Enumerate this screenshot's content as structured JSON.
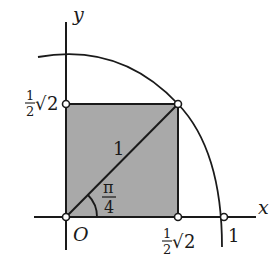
{
  "diagram": {
    "axes": {
      "x_label": "x",
      "y_label": "y",
      "origin_label": "O"
    },
    "labels": {
      "hypotenuse": "1",
      "x_intercept": "1",
      "angle_num": "π",
      "angle_den": "4",
      "half_num": "1",
      "half_den": "2",
      "sqrt_symbol": "√",
      "sqrt_arg": "2"
    },
    "colors": {
      "stroke": "#1a1a1a",
      "fill": "#a9a9a9",
      "background": "#ffffff"
    },
    "geometry": {
      "origin": [
        66,
        217
      ],
      "radius_px": 158,
      "square_corner": [
        178,
        104
      ]
    }
  }
}
